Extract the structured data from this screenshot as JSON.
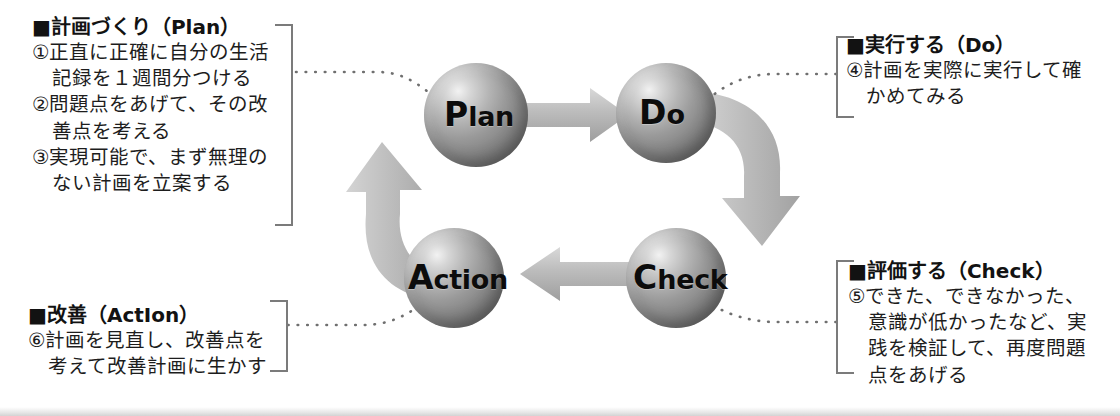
{
  "diagram": {
    "accent_color": "#b9b9b9",
    "sphere_color": "#8e8e8e",
    "bracket_color": "#7b7b7b",
    "connector_color": "#6f6f6f"
  },
  "nodes": [
    {
      "id": "plan",
      "cap": "P",
      "rest": "lan",
      "full": "Plan"
    },
    {
      "id": "do",
      "cap": "D",
      "rest": "o",
      "full": "Do"
    },
    {
      "id": "check",
      "cap": "C",
      "rest": "heck",
      "full": "Check"
    },
    {
      "id": "action",
      "cap": "A",
      "rest": "ction",
      "full": "Action"
    }
  ],
  "arrows": [
    {
      "id": "plan-to-do",
      "from": "Plan",
      "to": "Do",
      "shape": "straight"
    },
    {
      "id": "do-to-check",
      "from": "Do",
      "to": "Check",
      "shape": "curve-right"
    },
    {
      "id": "check-to-action",
      "from": "Check",
      "to": "Action",
      "shape": "straight"
    },
    {
      "id": "action-to-plan",
      "from": "Action",
      "to": "Plan",
      "shape": "curve-left"
    }
  ],
  "blocks": {
    "plan": {
      "heading": "■計画づくり（Plan）",
      "lines": [
        {
          "text": "①正直に正確に自分の生活",
          "indent": false
        },
        {
          "text": "記録を１週間分つける",
          "indent": true
        },
        {
          "text": "②問題点をあげて、その改",
          "indent": false
        },
        {
          "text": "善点を考える",
          "indent": true
        },
        {
          "text": "③実現可能で、まず無理の",
          "indent": false
        },
        {
          "text": "ない計画を立案する",
          "indent": true
        }
      ]
    },
    "do": {
      "heading": "■実行する（Do）",
      "lines": [
        {
          "text": "④計画を実際に実行して確",
          "indent": false
        },
        {
          "text": "かめてみる",
          "indent": true
        }
      ]
    },
    "check": {
      "heading": "■評価する（Check）",
      "lines": [
        {
          "text": "⑤できた、できなかった、",
          "indent": false
        },
        {
          "text": "意識が低かったなど、実",
          "indent": true
        },
        {
          "text": "践を検証して、再度問題",
          "indent": true
        },
        {
          "text": "点をあげる",
          "indent": true
        }
      ]
    },
    "action": {
      "heading": "■改善（ActIon）",
      "lines": [
        {
          "text": "⑥計画を見直し、改善点を",
          "indent": false
        },
        {
          "text": "考えて改善計画に生かす",
          "indent": true
        }
      ]
    }
  }
}
